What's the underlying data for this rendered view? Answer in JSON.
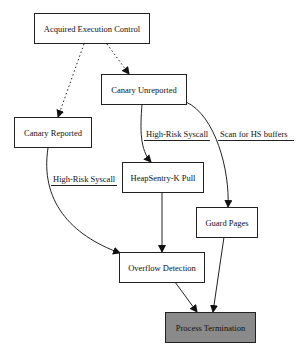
{
  "nodes": [
    {
      "id": "acquired",
      "label": "Acquired Execution Control"
    },
    {
      "id": "unreported",
      "label": "Canary Unreported"
    },
    {
      "id": "reported",
      "label": "Canary Reported"
    },
    {
      "id": "heapsentry",
      "label": "HeapSentry-K Pull"
    },
    {
      "id": "guard",
      "label": "Guard Pages"
    },
    {
      "id": "overflow",
      "label": "Overflow Detection"
    },
    {
      "id": "termination",
      "label": "Process Termination",
      "fill": "#8a8a8a"
    }
  ],
  "edges": [
    {
      "from": "acquired",
      "to": "reported",
      "style": "dotted",
      "label": ""
    },
    {
      "from": "acquired",
      "to": "unreported",
      "style": "dotted",
      "label": ""
    },
    {
      "from": "unreported",
      "to": "heapsentry",
      "style": "solid",
      "label": "High-Risk Syscall"
    },
    {
      "from": "unreported",
      "to": "guard",
      "style": "solid",
      "label": "Scan for HS buffers"
    },
    {
      "from": "reported",
      "to": "overflow",
      "style": "solid",
      "label": "High-Risk Syscall"
    },
    {
      "from": "heapsentry",
      "to": "overflow",
      "style": "solid",
      "label": ""
    },
    {
      "from": "overflow",
      "to": "termination",
      "style": "solid",
      "label": ""
    },
    {
      "from": "guard",
      "to": "termination",
      "style": "solid",
      "label": ""
    }
  ]
}
